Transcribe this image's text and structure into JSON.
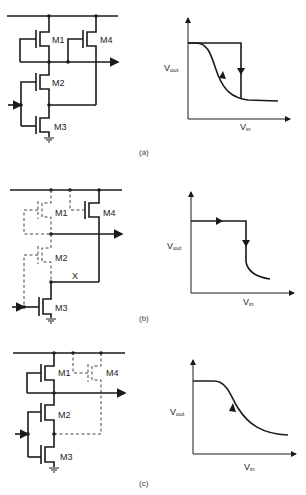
{
  "figure": {
    "panels": [
      {
        "id": "a",
        "caption": "(a)",
        "circuit": {
          "transistors": [
            "M1",
            "M2",
            "M3",
            "M4"
          ],
          "active": [
            "M1",
            "M2",
            "M3",
            "M4"
          ],
          "dashed": []
        },
        "graph": {
          "y_label": "V",
          "y_label_sub": "out",
          "x_label": "V",
          "x_label_sub": "in",
          "description": "Hysteresis loop: high plateau then vertical drop (down arrow), return path along smooth S-curve (up arrow)"
        }
      },
      {
        "id": "b",
        "caption": "(b)",
        "circuit": {
          "transistors": [
            "M1",
            "M2",
            "M3",
            "M4"
          ],
          "active": [
            "M3",
            "M4"
          ],
          "dashed": [
            "M1",
            "M2"
          ],
          "node_label": "X"
        },
        "graph": {
          "y_label": "V",
          "y_label_sub": "out",
          "x_label": "V",
          "x_label_sub": "in",
          "description": "Forward path: high plateau (right arrow) then abrupt vertical drop (down arrow), then low tail"
        }
      },
      {
        "id": "c",
        "caption": "(c)",
        "circuit": {
          "transistors": [
            "M1",
            "M2",
            "M3",
            "M4"
          ],
          "active": [
            "M1",
            "M2",
            "M3"
          ],
          "dashed": [
            "M4"
          ]
        },
        "graph": {
          "y_label": "V",
          "y_label_sub": "out",
          "x_label": "V",
          "x_label_sub": "in",
          "description": "Reverse path: smooth S-shaped transfer curve (up arrow)"
        }
      }
    ],
    "labels": {
      "m1": "M1",
      "m2": "M2",
      "m3": "M3",
      "m4": "M4",
      "node_x": "X"
    }
  }
}
